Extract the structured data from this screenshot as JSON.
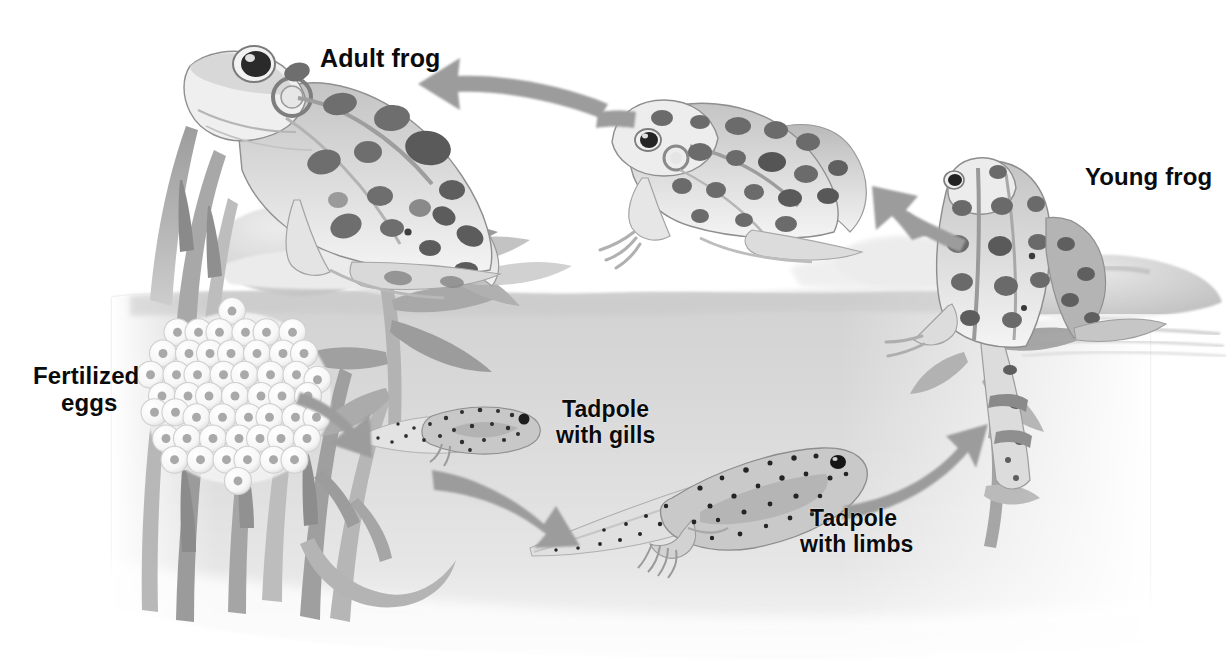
{
  "figure": {
    "type": "illustration-diagram",
    "medium": "grayscale watercolor illustration",
    "background_color": "#ffffff",
    "water_color": "#dcdcdc",
    "arrow_color": "#9a9a9a",
    "label_color": "#0b0b0b",
    "stages": [
      {
        "id": "adult-frog",
        "label": "Adult frog",
        "label_lines": [
          "Adult frog"
        ],
        "position": {
          "x": 320,
          "y": 44
        }
      },
      {
        "id": "fertilized-eggs",
        "label": "Fertilized eggs",
        "label_lines": [
          "Fertilized",
          "eggs"
        ],
        "position": {
          "x": 33,
          "y": 363
        }
      },
      {
        "id": "tadpole-with-gills",
        "label": "Tadpole with gills",
        "label_lines": [
          "Tadpole",
          "with gills"
        ],
        "position": {
          "x": 556,
          "y": 397
        }
      },
      {
        "id": "tadpole-with-limbs",
        "label": "Tadpole with limbs",
        "label_lines": [
          "Tadpole",
          "with limbs"
        ],
        "position": {
          "x": 800,
          "y": 506
        }
      },
      {
        "id": "young-frog",
        "label": "Young frog",
        "label_lines": [
          "Young frog"
        ],
        "position": {
          "x": 1085,
          "y": 164
        }
      }
    ],
    "arrows": [
      {
        "id": "arrow-eggs-to-tadpole",
        "from": "fertilized-eggs",
        "to": "tadpole-with-gills",
        "direction": "down-right"
      },
      {
        "id": "arrow-tadpole-to-limbs",
        "from": "tadpole-with-gills",
        "to": "tadpole-with-limbs",
        "direction": "down-right"
      },
      {
        "id": "arrow-limbs-to-young",
        "from": "tadpole-with-limbs",
        "to": "young-frog",
        "direction": "up-right"
      },
      {
        "id": "arrow-young-to-middle",
        "from": "young-frog",
        "to": "middle-frog",
        "direction": "up-left"
      },
      {
        "id": "arrow-middle-to-adult",
        "from": "middle-frog",
        "to": "adult-frog",
        "direction": "left"
      }
    ]
  }
}
